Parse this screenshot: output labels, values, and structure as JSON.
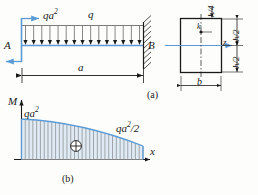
{
  "figure": {
    "title_a": "(a)",
    "title_b": "(b)"
  },
  "beam": {
    "support_left_label": "A",
    "support_right_label": "B",
    "moment_load_label": "qa",
    "moment_load_exp": "2",
    "distributed_load_label": "q",
    "span_label": "a",
    "num_load_arrows": 15
  },
  "moment_diagram": {
    "axis_vertical_label": "M",
    "axis_horizontal_label": "x",
    "left_value_label": "qa",
    "left_value_exp": "2",
    "right_value_label": "qa",
    "right_value_exp": "2",
    "right_value_suffix": "/2",
    "sign_symbol": "⊕",
    "num_hatch_lines": 32
  },
  "cross_section": {
    "top_dim_label": "h/4",
    "upper_half_label": "h/2",
    "lower_half_label": "h/2",
    "width_label": "b",
    "point_label": "k",
    "axis_label": "z"
  },
  "colors": {
    "accent": "#5b9bd5",
    "ink": "#1a1a1a",
    "hatch": "#7f7f7f",
    "fill": "#dfeaf4"
  }
}
